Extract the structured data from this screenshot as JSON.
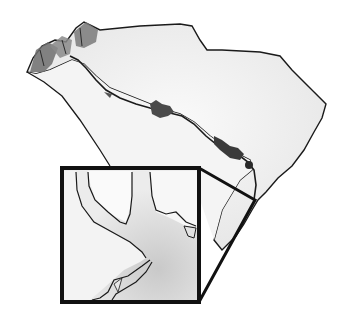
{
  "map": {
    "subject": "South Carolina state outline with river border",
    "style": "grayscale watercolor illustration",
    "colors": {
      "background": "#ffffff",
      "land_fill": "#f2f2f2",
      "outline": "#1a1a1a",
      "mountains": "#6e6e6e",
      "lakes": "#3a3a3a",
      "inset_water": "#d6d6d6"
    },
    "features": [
      "state-outline",
      "river-border",
      "reservoir-lakes",
      "mountain-shading",
      "inset-zoom-box"
    ],
    "inset": {
      "description": "Magnified view of river mouth / estuary near coast",
      "box": {
        "x": 62,
        "y": 168,
        "width": 137,
        "height": 134
      }
    }
  }
}
